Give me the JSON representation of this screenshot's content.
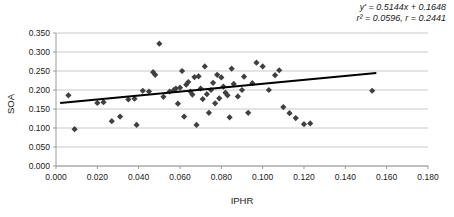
{
  "chart_data": {
    "type": "scatter",
    "title": "",
    "xlabel": "IPHR",
    "ylabel": "SOA",
    "xlim": [
      0.0,
      0.18
    ],
    "ylim": [
      0.0,
      0.35
    ],
    "xticks": [
      "0.000",
      "0.020",
      "0.040",
      "0.060",
      "0.080",
      "0.100",
      "0.120",
      "0.140",
      "0.160",
      "0.180"
    ],
    "xtick_values": [
      0.0,
      0.02,
      0.04,
      0.06,
      0.08,
      0.1,
      0.12,
      0.14,
      0.16,
      0.18
    ],
    "yticks": [
      "0.000",
      "0.050",
      "0.100",
      "0.150",
      "0.200",
      "0.250",
      "0.300",
      "0.350"
    ],
    "ytick_values": [
      0.0,
      0.05,
      0.1,
      0.15,
      0.2,
      0.25,
      0.3,
      0.35
    ],
    "grid": "horizontal",
    "legend": "none",
    "marker": "diamond",
    "marker_color": "#404040",
    "trendline_color": "#000000",
    "annotations": {
      "equation": "y' = 0.5144x + 0.1648",
      "fit_stats": "r² = 0.0596, r = 0.2441"
    },
    "regression": {
      "slope": 0.5144,
      "intercept": 0.1648,
      "r_squared": 0.0596,
      "r": 0.2441,
      "x_start": 0.002,
      "x_end": 0.155
    },
    "points": [
      [
        0.006,
        0.186
      ],
      [
        0.009,
        0.097
      ],
      [
        0.02,
        0.166
      ],
      [
        0.023,
        0.168
      ],
      [
        0.027,
        0.118
      ],
      [
        0.031,
        0.13
      ],
      [
        0.035,
        0.175
      ],
      [
        0.038,
        0.177
      ],
      [
        0.039,
        0.108
      ],
      [
        0.042,
        0.198
      ],
      [
        0.045,
        0.196
      ],
      [
        0.047,
        0.247
      ],
      [
        0.048,
        0.24
      ],
      [
        0.05,
        0.322
      ],
      [
        0.052,
        0.182
      ],
      [
        0.055,
        0.196
      ],
      [
        0.057,
        0.2
      ],
      [
        0.058,
        0.204
      ],
      [
        0.059,
        0.164
      ],
      [
        0.06,
        0.206
      ],
      [
        0.061,
        0.25
      ],
      [
        0.062,
        0.13
      ],
      [
        0.063,
        0.214
      ],
      [
        0.064,
        0.221
      ],
      [
        0.065,
        0.196
      ],
      [
        0.066,
        0.188
      ],
      [
        0.067,
        0.234
      ],
      [
        0.068,
        0.108
      ],
      [
        0.069,
        0.236
      ],
      [
        0.07,
        0.204
      ],
      [
        0.071,
        0.176
      ],
      [
        0.072,
        0.262
      ],
      [
        0.073,
        0.189
      ],
      [
        0.074,
        0.14
      ],
      [
        0.075,
        0.2
      ],
      [
        0.076,
        0.219
      ],
      [
        0.077,
        0.165
      ],
      [
        0.078,
        0.24
      ],
      [
        0.079,
        0.178
      ],
      [
        0.08,
        0.233
      ],
      [
        0.081,
        0.209
      ],
      [
        0.082,
        0.193
      ],
      [
        0.083,
        0.186
      ],
      [
        0.084,
        0.128
      ],
      [
        0.085,
        0.256
      ],
      [
        0.086,
        0.216
      ],
      [
        0.088,
        0.183
      ],
      [
        0.09,
        0.2
      ],
      [
        0.091,
        0.235
      ],
      [
        0.093,
        0.14
      ],
      [
        0.095,
        0.218
      ],
      [
        0.097,
        0.272
      ],
      [
        0.1,
        0.262
      ],
      [
        0.103,
        0.2
      ],
      [
        0.106,
        0.239
      ],
      [
        0.108,
        0.252
      ],
      [
        0.11,
        0.155
      ],
      [
        0.113,
        0.139
      ],
      [
        0.116,
        0.126
      ],
      [
        0.12,
        0.11
      ],
      [
        0.123,
        0.112
      ],
      [
        0.153,
        0.198
      ]
    ]
  }
}
